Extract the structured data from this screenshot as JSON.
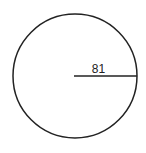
{
  "diagram": {
    "type": "circle-with-radius",
    "circle": {
      "cx": 75,
      "cy": 76,
      "r": 62,
      "stroke": "#222222",
      "stroke_width": 1.5
    },
    "radius_line": {
      "x1": 74,
      "y1": 76,
      "x2": 137,
      "y2": 76,
      "stroke": "#222222"
    },
    "radius_label": {
      "text": "81",
      "x": 98.5,
      "y": 73
    }
  }
}
